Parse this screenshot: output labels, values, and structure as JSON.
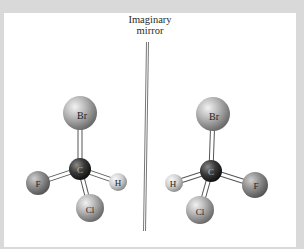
{
  "figure": {
    "mirror_label_line1": "Imaginary",
    "mirror_label_line2": "mirror"
  },
  "colors": {
    "frame": "#d9d9d9",
    "panel": "#ffffff",
    "atom_light": "#dcdcdc",
    "atom_mid": "#9a9a9a",
    "atom_dark": "#6e6e6e",
    "carbon": "#2c2c2c",
    "bond": "#ffffff",
    "bond_outline": "#555555"
  },
  "molecules": [
    {
      "name": "left-enantiomer",
      "atoms": [
        {
          "id": "Br",
          "label": "Br",
          "x": 80,
          "y": 113,
          "r": 17
        },
        {
          "id": "C",
          "label": "C",
          "x": 80,
          "y": 169,
          "r": 11
        },
        {
          "id": "F",
          "label": "F",
          "x": 38,
          "y": 183,
          "r": 12
        },
        {
          "id": "H",
          "label": "H",
          "x": 118,
          "y": 182,
          "r": 9
        },
        {
          "id": "Cl",
          "label": "Cl",
          "x": 90,
          "y": 208,
          "r": 14
        }
      ]
    },
    {
      "name": "right-enantiomer",
      "atoms": [
        {
          "id": "Br",
          "label": "Br",
          "x": 213,
          "y": 114,
          "r": 17
        },
        {
          "id": "C",
          "label": "C",
          "x": 211,
          "y": 171,
          "r": 11
        },
        {
          "id": "H",
          "label": "H",
          "x": 174,
          "y": 183,
          "r": 9
        },
        {
          "id": "F",
          "label": "F",
          "x": 255,
          "y": 185,
          "r": 13
        },
        {
          "id": "Cl",
          "label": "Cl",
          "x": 200,
          "y": 210,
          "r": 14
        }
      ]
    }
  ]
}
